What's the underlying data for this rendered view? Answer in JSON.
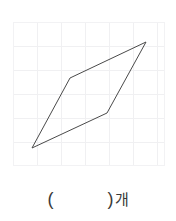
{
  "worksheet": {
    "background_color": "#ffffff",
    "grid": {
      "name": "graph-paper-grid",
      "left": 13,
      "top": 22,
      "width": 152,
      "height": 144,
      "cell_size": 24,
      "line_color": "#f0f0f2",
      "columns": 6,
      "rows": 6
    },
    "figure": {
      "name": "parallelogram",
      "shape_type": "parallelogram",
      "stroke_color": "#4a4a4a",
      "stroke_width": 1,
      "fill": "none",
      "closed": true,
      "vertices": [
        {
          "label": "bottom-left",
          "x": 32,
          "y": 148
        },
        {
          "label": "middle-upper-left",
          "x": 70,
          "y": 78
        },
        {
          "label": "top-right",
          "x": 146,
          "y": 42
        },
        {
          "label": "middle-lower-right",
          "x": 107,
          "y": 113
        }
      ],
      "points_string": "32,148 70,78 146,42 107,113"
    },
    "answer_prompt": {
      "name": "answer-prompt",
      "open_paren": "(",
      "blank_value": "",
      "close_paren": ")",
      "unit": "개",
      "full_text": "(    )개"
    }
  }
}
